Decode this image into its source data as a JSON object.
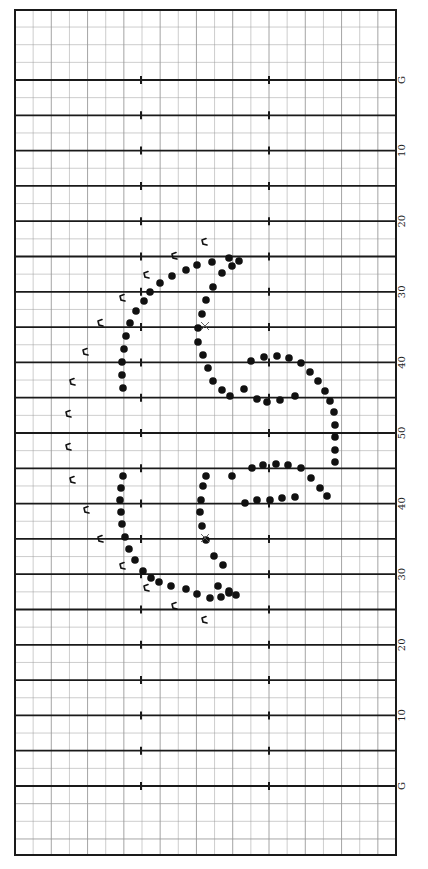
{
  "chart_data": {
    "type": "scatter",
    "title": "",
    "field": {
      "orientation": "vertical",
      "yard_line_labels": [
        "G",
        "10",
        "20",
        "30",
        "40",
        "50",
        "40",
        "30",
        "20",
        "10",
        "G"
      ],
      "yard_lines": [
        "G",
        "5",
        "10",
        "15",
        "20",
        "25",
        "30",
        "35",
        "40",
        "45",
        "50",
        "45",
        "40",
        "35",
        "30",
        "25",
        "20",
        "15",
        "10",
        "5",
        "G"
      ],
      "hash_marks": 2,
      "grid": true
    },
    "colors": {
      "line": "#1a1a1a",
      "grid": "#9a9a9a",
      "dot": "#111111",
      "background": "#ffffff"
    },
    "series": [
      {
        "name": "performers",
        "marker": "dot",
        "points": [
          [
            229,
            258
          ],
          [
            212,
            262
          ],
          [
            197,
            265
          ],
          [
            186,
            270
          ],
          [
            172,
            276
          ],
          [
            160,
            283
          ],
          [
            150,
            292
          ],
          [
            144,
            301
          ],
          [
            136,
            311
          ],
          [
            130,
            323
          ],
          [
            126,
            336
          ],
          [
            124,
            349
          ],
          [
            122,
            362
          ],
          [
            122,
            375
          ],
          [
            123,
            388
          ],
          [
            239,
            261
          ],
          [
            232,
            266
          ],
          [
            222,
            273
          ],
          [
            213,
            287
          ],
          [
            206,
            300
          ],
          [
            202,
            314
          ],
          [
            198,
            328
          ],
          [
            198,
            342
          ],
          [
            203,
            355
          ],
          [
            208,
            368
          ],
          [
            213,
            381
          ],
          [
            222,
            390
          ],
          [
            230,
            396
          ],
          [
            251,
            361
          ],
          [
            264,
            357
          ],
          [
            277,
            356
          ],
          [
            289,
            358
          ],
          [
            301,
            363
          ],
          [
            310,
            372
          ],
          [
            318,
            381
          ],
          [
            325,
            391
          ],
          [
            330,
            401
          ],
          [
            334,
            412
          ],
          [
            335,
            425
          ],
          [
            335,
            437
          ],
          [
            335,
            450
          ],
          [
            335,
            462
          ],
          [
            244,
            389
          ],
          [
            257,
            399
          ],
          [
            267,
            402
          ],
          [
            280,
            400
          ],
          [
            295,
            396
          ],
          [
            252,
            468
          ],
          [
            263,
            465
          ],
          [
            276,
            464
          ],
          [
            288,
            465
          ],
          [
            301,
            468
          ],
          [
            311,
            478
          ],
          [
            320,
            488
          ],
          [
            327,
            496
          ],
          [
            232,
            476
          ],
          [
            245,
            503
          ],
          [
            257,
            500
          ],
          [
            270,
            500
          ],
          [
            282,
            498
          ],
          [
            295,
            497
          ],
          [
            123,
            476
          ],
          [
            121,
            488
          ],
          [
            120,
            500
          ],
          [
            121,
            512
          ],
          [
            122,
            524
          ],
          [
            125,
            537
          ],
          [
            129,
            549
          ],
          [
            135,
            560
          ],
          [
            143,
            571
          ],
          [
            151,
            578
          ],
          [
            159,
            582
          ],
          [
            171,
            586
          ],
          [
            186,
            589
          ],
          [
            197,
            594
          ],
          [
            210,
            598
          ],
          [
            221,
            597
          ],
          [
            229,
            593
          ],
          [
            223,
            565
          ],
          [
            214,
            556
          ],
          [
            206,
            540
          ],
          [
            202,
            526
          ],
          [
            200,
            512
          ],
          [
            201,
            500
          ],
          [
            203,
            486
          ],
          [
            206,
            476
          ],
          [
            218,
            586
          ],
          [
            229,
            591
          ],
          [
            236,
            595
          ]
        ]
      },
      {
        "name": "flags",
        "marker": "flag",
        "points": [
          [
            204,
            242
          ],
          [
            174,
            256
          ],
          [
            146,
            275
          ],
          [
            122,
            298
          ],
          [
            100,
            323
          ],
          [
            85,
            352
          ],
          [
            72,
            382
          ],
          [
            68,
            414
          ],
          [
            68,
            447
          ],
          [
            72,
            480
          ],
          [
            86,
            510
          ],
          [
            100,
            539
          ],
          [
            122,
            566
          ],
          [
            146,
            588
          ],
          [
            174,
            606
          ],
          [
            204,
            620
          ]
        ]
      },
      {
        "name": "pivots",
        "marker": "x",
        "points": [
          [
            205,
            326
          ],
          [
            205,
            538
          ]
        ]
      }
    ]
  }
}
